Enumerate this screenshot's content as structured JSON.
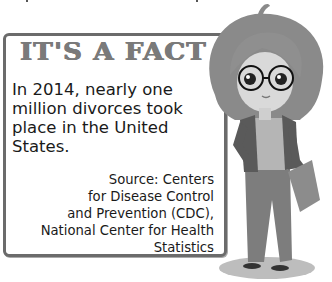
{
  "fact_box": {
    "title": "IT'S A FACT",
    "body_lines": [
      "In 2014, nearly one",
      "million divorces took",
      "place in the United",
      "States."
    ],
    "source_lines": [
      "Source: Centers",
      "for Disease Control",
      "and Prevention (CDC),",
      "National Center for Health",
      "Statistics"
    ]
  },
  "illustration": {
    "subject": "cartoon-girl-with-glasses-holding-folder"
  },
  "colors": {
    "border": "#6b6b6b",
    "title": "#7a7a7a",
    "text": "#1a1a1a"
  }
}
